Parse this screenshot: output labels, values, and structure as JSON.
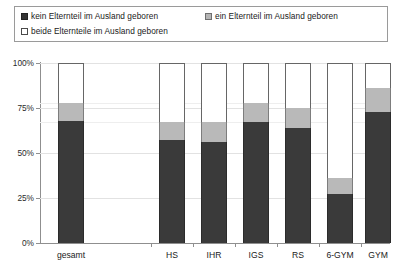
{
  "legend": {
    "items": [
      {
        "label": "kein Elternteil im Ausland geboren",
        "swatch": "black-square-icon",
        "color": "#333333"
      },
      {
        "label": "ein Elternteil im Ausland geboren",
        "swatch": "gray-square-icon",
        "color": "#b5b5b5"
      },
      {
        "label": "beide Elternteile im Ausland geboren",
        "swatch": "white-square-icon",
        "color": "#ffffff"
      }
    ]
  },
  "axis": {
    "y_ticks": [
      "0%",
      "25%",
      "50%",
      "75%",
      "100%"
    ],
    "x_ticks": [
      "gesamt",
      "HS",
      "IHR",
      "IGS",
      "RS",
      "6-GYM",
      "GYM"
    ]
  },
  "chart_data": {
    "type": "bar",
    "title": "",
    "subtitle": "",
    "xlabel": "",
    "ylabel": "",
    "ylim": [
      0,
      100
    ],
    "grid": true,
    "stacked": true,
    "legend_position": "top",
    "categories": [
      "gesamt",
      "HS",
      "IHR",
      "IGS",
      "RS",
      "6-GYM",
      "GYM"
    ],
    "series": [
      {
        "name": "kein Elternteil im Ausland geboren",
        "color": "#3a3a3a",
        "values": [
          68,
          57,
          56,
          67,
          64,
          27,
          73
        ]
      },
      {
        "name": "ein Elternteil im Ausland geboren",
        "color": "#b9b9b9",
        "values": [
          10,
          10,
          11,
          11,
          11,
          9,
          13
        ]
      },
      {
        "name": "beide Elternteile im Ausland geboren",
        "color": "#ffffff",
        "values": [
          22,
          33,
          33,
          22,
          25,
          64,
          14
        ]
      }
    ],
    "ytick_values": [
      0,
      25,
      50,
      75,
      100
    ]
  }
}
